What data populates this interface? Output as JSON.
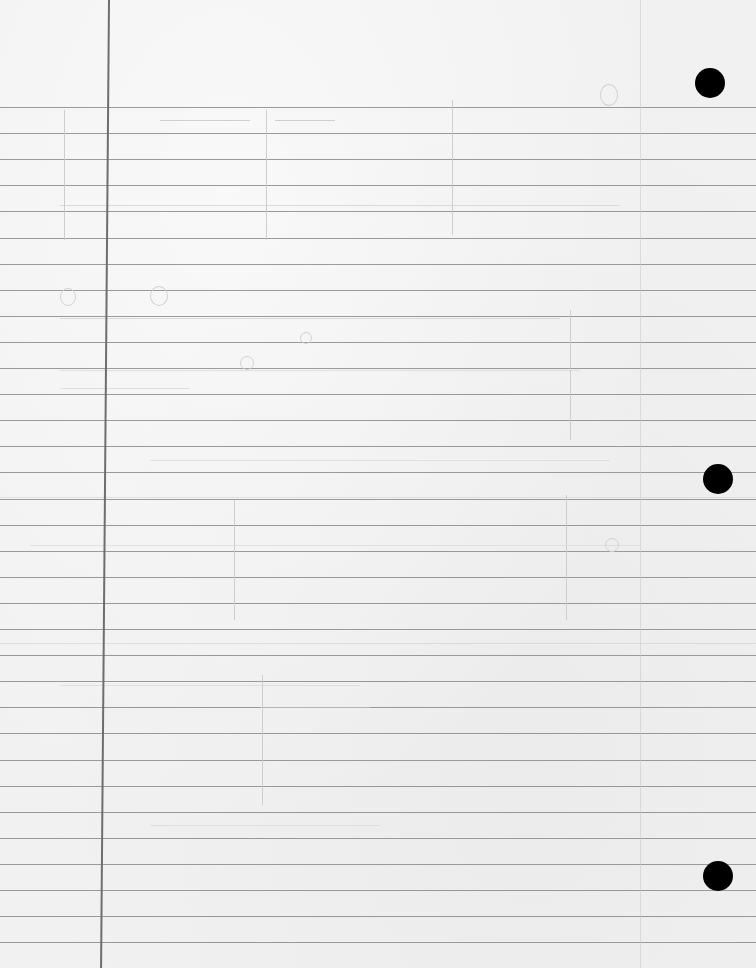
{
  "document": {
    "type": "ruled-notebook-paper",
    "content": "blank",
    "colors": {
      "paper": "#f1f1f1",
      "rule_line": "#8a8a8a",
      "margin_line": "#6e6e6e",
      "hole": "#000000",
      "bleed_through": "#cfcfcf"
    },
    "rules": {
      "first_y": 107,
      "spacing": 26.1,
      "count": 33
    },
    "margin_line_x": 109,
    "holes": [
      {
        "x": 710,
        "y": 83
      },
      {
        "x": 718,
        "y": 479
      },
      {
        "x": 718,
        "y": 876
      }
    ]
  }
}
